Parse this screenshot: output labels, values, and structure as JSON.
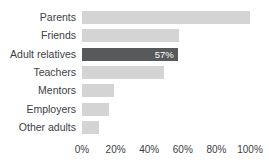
{
  "chart_data": {
    "type": "bar",
    "orientation": "horizontal",
    "title": "",
    "xlabel": "",
    "ylabel": "",
    "xlim": [
      0,
      100
    ],
    "grid": false,
    "legend": null,
    "categories": [
      "Parents",
      "Friends",
      "Adult relatives",
      "Teachers",
      "Mentors",
      "Employers",
      "Other adults"
    ],
    "values": [
      100,
      58,
      57,
      49,
      19,
      16,
      10
    ],
    "value_labels": [
      "",
      "",
      "57%",
      "",
      "",
      "",
      ""
    ],
    "highlighted_category": "Adult relatives",
    "tick_labels": [
      "0%",
      "20%",
      "40%",
      "60%",
      "80%",
      "100%"
    ],
    "tick_values": [
      0,
      20,
      40,
      60,
      80,
      100
    ],
    "colors": {
      "bar": "#d4d4d4",
      "bar_highlight": "#58595b",
      "value_label": "#ffffff",
      "text": "#3d3d45",
      "background": "#ffffff"
    }
  }
}
